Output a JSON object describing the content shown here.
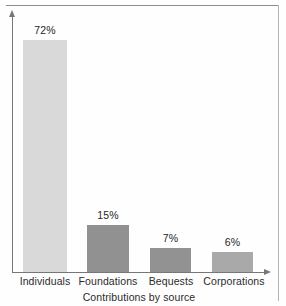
{
  "chart_data": {
    "type": "bar",
    "title": "",
    "subtitle": "",
    "xlabel": "Contributions by source",
    "ylabel": "",
    "categories": [
      "Individuals",
      "Foundations",
      "Bequests",
      "Corporations"
    ],
    "values": [
      72,
      15,
      7,
      6
    ],
    "value_labels": [
      "72%",
      "15%",
      "7%",
      "6%"
    ],
    "unit": "%",
    "ylim": [
      0,
      72
    ],
    "grid": false,
    "legend": null,
    "annotations": [],
    "bar_colors": [
      "#d9d9d9",
      "#919191",
      "#929292",
      "#a9a9a9"
    ],
    "axis_color": "#777777",
    "label_color": "#2b2b2b",
    "geometry": {
      "baseline_y": 272,
      "axis_x": 12,
      "bars": [
        {
          "x": 23,
          "width": 44,
          "top": 40
        },
        {
          "x": 87,
          "width": 42,
          "top": 225
        },
        {
          "x": 150,
          "width": 41,
          "top": 248
        },
        {
          "x": 212,
          "width": 41,
          "top": 252
        }
      ],
      "value_label_positions": [
        {
          "left": 23,
          "width": 44,
          "top": 24
        },
        {
          "left": 87,
          "width": 42,
          "top": 209
        },
        {
          "left": 150,
          "width": 41,
          "top": 232
        },
        {
          "left": 212,
          "width": 41,
          "top": 236
        }
      ],
      "category_label_positions": [
        {
          "left": 8,
          "width": 74
        },
        {
          "left": 71,
          "width": 74
        },
        {
          "left": 134,
          "width": 74
        },
        {
          "left": 196,
          "width": 76
        }
      ]
    }
  },
  "figure": {
    "axis_title": "Contributions by source",
    "bar1_label": "72%",
    "bar2_label": "15%",
    "bar3_label": "7%",
    "bar4_label": "6%",
    "cat1": "Individuals",
    "cat2": "Foundations",
    "cat3": "Bequests",
    "cat4": "Corporations"
  }
}
